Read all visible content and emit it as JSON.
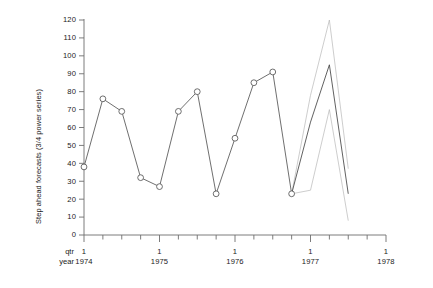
{
  "chart_data": {
    "type": "line",
    "title": "",
    "xlabel": "",
    "ylabel": "Step ahead forecasts (3/4 power series)",
    "ylim": [
      0,
      120
    ],
    "ytick_step": 10,
    "yticks": [
      "0",
      "10",
      "20",
      "30",
      "40",
      "50",
      "60",
      "70",
      "80",
      "90",
      "100",
      "110",
      "120"
    ],
    "grid": false,
    "legend": "none",
    "x_axis": {
      "row_labels": [
        "qtr",
        "year"
      ],
      "year_ticks": [
        {
          "qtr": "1",
          "year": "1974"
        },
        {
          "qtr": "1",
          "year": "1975"
        },
        {
          "qtr": "1",
          "year": "1976"
        },
        {
          "qtr": "1",
          "year": "1977"
        },
        {
          "qtr": "1",
          "year": "1978"
        }
      ],
      "minor_ticks_per_year": 4
    },
    "x": [
      "1974 Q1",
      "1974 Q2",
      "1974 Q3",
      "1974 Q4",
      "1975 Q1",
      "1975 Q2",
      "1975 Q3",
      "1975 Q4",
      "1976 Q1",
      "1976 Q2",
      "1976 Q3",
      "1976 Q4",
      "1977 Q1",
      "1977 Q2",
      "1977 Q3",
      "1977 Q4",
      "1978 Q1"
    ],
    "series": [
      {
        "name": "observed",
        "marker": "open-circle",
        "style": "solid",
        "color": "#555555",
        "values": [
          38,
          76,
          69,
          32,
          27,
          69,
          80,
          23,
          54,
          85,
          91,
          23,
          null,
          null,
          null,
          null,
          null
        ]
      },
      {
        "name": "forecast",
        "marker": "none",
        "style": "solid",
        "color": "#444444",
        "values": [
          null,
          null,
          null,
          null,
          null,
          null,
          null,
          null,
          null,
          null,
          null,
          23,
          63,
          95,
          23,
          null,
          null
        ]
      },
      {
        "name": "upper-bound",
        "marker": "none",
        "style": "solid",
        "color": "#b8b8b8",
        "values": [
          null,
          null,
          null,
          null,
          null,
          null,
          null,
          null,
          null,
          null,
          null,
          23,
          78,
          120,
          37,
          null,
          null
        ]
      },
      {
        "name": "lower-bound",
        "marker": "none",
        "style": "solid",
        "color": "#b8b8b8",
        "values": [
          null,
          null,
          null,
          null,
          null,
          null,
          null,
          null,
          null,
          null,
          null,
          23,
          25,
          70,
          8,
          null,
          null
        ]
      }
    ]
  }
}
